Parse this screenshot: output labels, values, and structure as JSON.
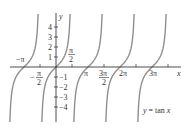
{
  "chart_data": {
    "type": "line",
    "title": "",
    "function": "y = tan x",
    "xlabel": "x",
    "ylabel": "y",
    "legend": [],
    "annotation": "y = tan x",
    "grid": false,
    "xlim": [
      -4.9,
      7.8
    ],
    "ylim": [
      -5.5,
      5.3
    ],
    "x_tick_positions": [
      -4.712,
      -3.1416,
      -1.5708,
      1.5708,
      3.1416,
      4.7124,
      6.2832,
      7.854,
      9.4248,
      10.9956
    ],
    "x_tick_labels": [
      {
        "label": "-π",
        "value": -3.1416,
        "position": "above"
      },
      {
        "label": "-π/2",
        "value": -1.5708,
        "position": "below"
      },
      {
        "label": "π/2",
        "value": 1.5708,
        "position": "above"
      },
      {
        "label": "π",
        "value": 3.1416,
        "position": "below"
      },
      {
        "label": "3π/2",
        "value": 4.7124,
        "position": "below"
      },
      {
        "label": "2π",
        "value": 6.2832,
        "position": "below"
      },
      {
        "label": "3π",
        "value": 9.4248,
        "position": "below"
      }
    ],
    "y_ticks": [
      -4,
      -3,
      -2,
      -1,
      1,
      2,
      3,
      4
    ],
    "y_tick_labels": [
      "-4",
      "-3",
      "-2",
      "-1",
      "1",
      "2",
      "3",
      "4"
    ],
    "branch_centers": [
      -3.1416,
      0,
      3.1416,
      6.2832,
      9.4248
    ],
    "asymptotes": [
      -4.7124,
      -1.5708,
      1.5708,
      4.7124,
      7.854,
      10.9956
    ],
    "sample_points": [
      {
        "x": -1.38,
        "y": -5.3
      },
      {
        "x": -1.0,
        "y": -1.557
      },
      {
        "x": -0.5,
        "y": -0.546
      },
      {
        "x": 0,
        "y": 0
      },
      {
        "x": 0.5,
        "y": 0.546
      },
      {
        "x": 1.0,
        "y": 1.557
      },
      {
        "x": 1.38,
        "y": 5.3
      }
    ],
    "curve_color": "#8f8f8f",
    "axis_color": "#3a3a3a"
  },
  "labels": {
    "y_axis": "y",
    "x_axis": "x",
    "neg_pi": "−π",
    "neg_half_pi_sign": "−",
    "pi_num": "π",
    "two": "2",
    "pi": "π",
    "three_pi_num": "3π",
    "two_pi": "2π",
    "three_pi": "3π",
    "y1": "1",
    "y2": "2",
    "y3": "3",
    "y4": "4",
    "yn1": "−1",
    "yn2": "−2",
    "yn3": "−3",
    "yn4": "−4",
    "eq_y": "y",
    "eq_mid": " = tan ",
    "eq_x": "x"
  }
}
